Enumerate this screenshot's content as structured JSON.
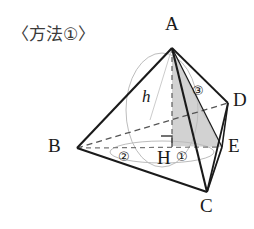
{
  "title": {
    "text": "〈方法①〉"
  },
  "figure": {
    "kind": "solid-geometry-diagram",
    "stroke_color": "#1a1a1a",
    "dashed_color": "#555555",
    "faint_color": "#b9b9b9",
    "shade_fill": "#d2d2d2",
    "vertices": [
      {
        "name": "A",
        "label": "A",
        "x": 172,
        "y": 48,
        "label_x": 165,
        "label_y": 18
      },
      {
        "name": "B",
        "label": "B",
        "x": 77,
        "y": 148,
        "label_x": 50,
        "label_y": 139
      },
      {
        "name": "C",
        "label": "C",
        "x": 207,
        "y": 192,
        "label_x": 200,
        "label_y": 199
      },
      {
        "name": "D",
        "label": "D",
        "x": 228,
        "y": 103,
        "label_x": 233,
        "label_y": 92
      },
      {
        "name": "E",
        "label": "E",
        "x": 222,
        "y": 147,
        "label_x": 228,
        "label_y": 138
      },
      {
        "name": "H",
        "label": "H",
        "x": 172,
        "y": 146,
        "label_x": 159,
        "label_y": 152
      }
    ],
    "height_label": {
      "text": "h",
      "x": 146,
      "y": 95
    },
    "circled_numbers": [
      {
        "name": "one",
        "text": "①",
        "x": 182,
        "y": 152
      },
      {
        "name": "two",
        "text": "②",
        "x": 124,
        "y": 152
      },
      {
        "name": "three",
        "text": "③",
        "x": 198,
        "y": 90
      }
    ],
    "right_angle_mark": {
      "at": "H",
      "x": 172,
      "y": 146,
      "size": 11
    }
  }
}
